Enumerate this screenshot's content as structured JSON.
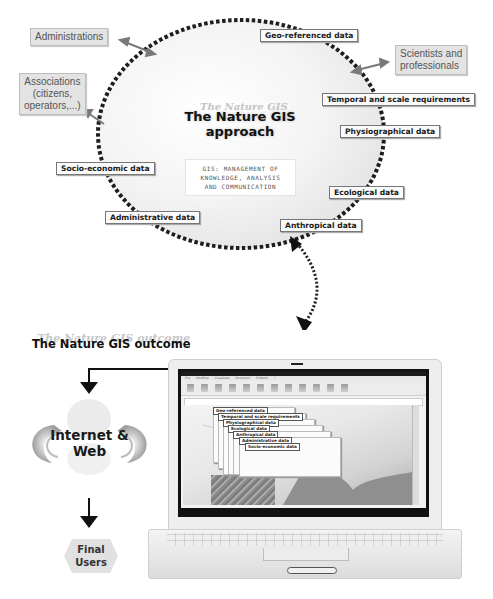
{
  "approach": {
    "title": "The Nature GIS approach",
    "title_line1": "The Nature GIS",
    "title_line2": "approach",
    "ghost_title": "The Nature GIS",
    "gis_box": {
      "line1": "GIS: Management of",
      "line2": "knowledge, analysis",
      "line3": "and communication"
    },
    "data_layers": [
      {
        "label": "Geo-referenced data"
      },
      {
        "label": "Temporal and scale requirements"
      },
      {
        "label": "Physiographical data"
      },
      {
        "label": "Ecological data"
      },
      {
        "label": "Anthropical data"
      },
      {
        "label": "Administrative data"
      },
      {
        "label": "Socio-economic data"
      }
    ],
    "stakeholders": [
      {
        "label": "Administrations"
      },
      {
        "label_line1": "Associations",
        "label_line2": "(citizens,",
        "label_line3": "operators,...)"
      },
      {
        "label_line1": "Scientists and",
        "label_line2": "professionals"
      }
    ]
  },
  "outcome": {
    "title": "The Nature GIS outcome",
    "ghost_title": "The Nature GIS outcome",
    "internet": {
      "line1": "Internet &",
      "line2": "Web"
    },
    "final_users": {
      "line1": "Final",
      "line2": "Users"
    }
  },
  "laptop_screen": {
    "menu": [
      "File",
      "Modifica",
      "Visualizza",
      "Strumenti",
      "Preferiti",
      "?"
    ],
    "layer_stack": [
      "Geo-referenced data",
      "Temporal and scale requirements",
      "Physiographical data",
      "Ecological data",
      "Anthropical data",
      "Administrative data",
      "Socio-economic data"
    ]
  },
  "colors": {
    "stakeholder_bg": "#e3e3e3",
    "tag_border": "#777777",
    "dots": "#222222",
    "arrow_gray": "#777777"
  }
}
